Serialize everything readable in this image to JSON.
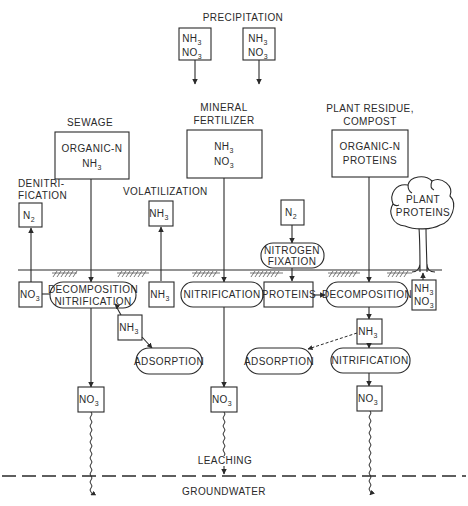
{
  "diagram": {
    "sources": {
      "precipitation": {
        "label": "PRECIPITATION",
        "box1": [
          "NH3",
          "NO3"
        ],
        "box2": [
          "NH3",
          "NO3"
        ]
      },
      "sewage": {
        "label": "SEWAGE",
        "box": [
          "ORGANIC-N",
          "NH3"
        ]
      },
      "mineral_fertilizer": {
        "label_line1": "MINERAL",
        "label_line2": "FERTILIZER",
        "box": [
          "NH3",
          "NO3"
        ]
      },
      "plant_residue": {
        "label_line1": "PLANT RESIDUE,",
        "label_line2": "COMPOST",
        "box": [
          "ORGANIC-N",
          "PROTEINS"
        ]
      }
    },
    "atmosphere": {
      "denitrification": {
        "label_line1": "DENITRI-",
        "label_line2": "FICATION",
        "box": "N2"
      },
      "volatilization": {
        "label": "VOLATILIZATION",
        "box": "NH3"
      },
      "fixation_source": {
        "box": "N2"
      },
      "nitrogen_fixation": {
        "line1": "NITROGEN",
        "line2": "FIXATION"
      },
      "plant_proteins": {
        "line1": "PLANT",
        "line2": "PROTEINS"
      }
    },
    "soil": {
      "no3_left": "NO3",
      "decomp_nitrif": {
        "line1": "DECOMPOSITION",
        "line2": "NITRIFICATION"
      },
      "nh3_mid": "NH3",
      "nh3_sewage_below": "NH3",
      "adsorption_left": "ADSORPTION",
      "nitrification_center": "NITRIFICATION",
      "proteins": "PROTEINS",
      "decomposition_right": "DECOMPOSITION",
      "nh3_no3_right": [
        "NH3",
        "NO3"
      ],
      "nh3_right_below": "NH3",
      "adsorption_right": "ADSORPTION",
      "nitrification_right": "NITRIFICATION",
      "no3_leach_left": "NO3",
      "no3_leach_center": "NO3",
      "no3_leach_right": "NO3"
    },
    "leaching_label": "LEACHING",
    "groundwater_label": "GROUNDWATER",
    "subscripts": {
      "three": "3",
      "two": "2"
    },
    "colors": {
      "ink": "#2a2a2a",
      "background": "#ffffff"
    }
  }
}
